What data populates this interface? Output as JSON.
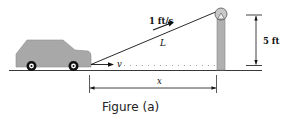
{
  "figure": {
    "caption": "Figure (a)",
    "labels": {
      "rope_speed": "1 ft/s",
      "rope_length": "L",
      "car_velocity": "v",
      "horizontal_distance": "x",
      "pulley_height": "5 ft"
    },
    "colors": {
      "car_body": "#a8a8a8",
      "car_outline": "#8a8a8a",
      "pole": "#b0b0b0",
      "line": "#111111",
      "dots": "#888888"
    }
  }
}
